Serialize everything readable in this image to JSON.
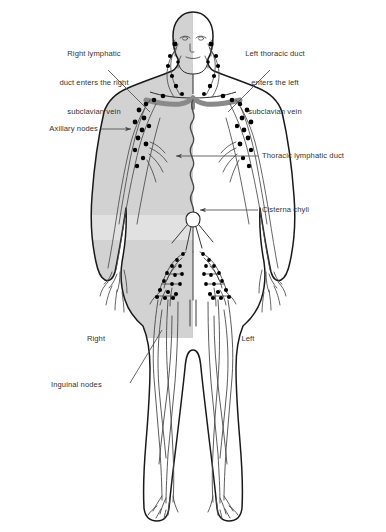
{
  "figure": {
    "background_color": "#ffffff",
    "text_color": "#333333",
    "outline_color": "#1a1a1a",
    "vessel_color": "#4a4a4a",
    "node_color": "#000000",
    "body_shade_color": "#d2d2d2",
    "vein_color": "#8a8a8a",
    "leader_color": "#555555"
  },
  "labels": {
    "right_lymphatic_duct": {
      "line1": "Right lymphatic",
      "line2": "duct enters the right",
      "line3": "subclavian vein"
    },
    "left_thoracic_duct": {
      "line1": "Left thoracic duct",
      "line2": "enters the left",
      "line3": "subclavian vein"
    },
    "axillary_nodes": "Axillary nodes",
    "thoracic_lymphatic_duct": "Thoracic lymphatic duct",
    "cisterna_chyli": "Cisterna chyli",
    "inguinal_nodes": "Inguinal nodes",
    "side_right": "Right",
    "side_left": "Left"
  }
}
